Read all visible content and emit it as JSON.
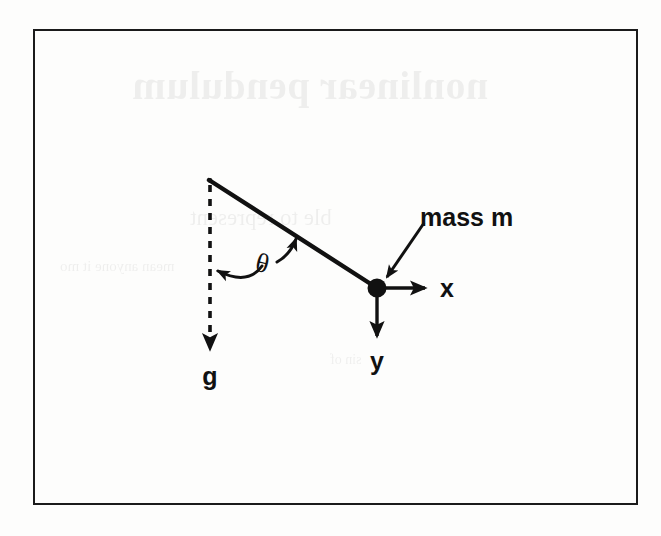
{
  "page": {
    "background_color": "#fdfdfc",
    "ink_color": "#111111"
  },
  "figure": {
    "frame": {
      "border_color": "#1b1b1b",
      "x": 33,
      "y": 29,
      "width": 605,
      "height": 476
    },
    "caption_bleed_through": {
      "note": "faint mirrored show-through text from the reverse side of the scanned page",
      "title": "nonlinear pendulum",
      "subtitle": "ble to represent",
      "line1": "mean   anyone   it   mo",
      "line2": "sin  of"
    },
    "labels": {
      "mass": "mass m",
      "x_axis": "x",
      "y_axis": "y",
      "gravity": "g",
      "angle": "θ"
    },
    "geometry": {
      "pivot": {
        "x": 210,
        "y": 180
      },
      "bob": {
        "x": 377,
        "y": 288,
        "radius": 9
      },
      "vertical_dashed_end": {
        "x": 210,
        "y": 350
      },
      "x_arrow_end": {
        "x": 427,
        "y": 288
      },
      "y_arrow_end": {
        "x": 377,
        "y": 338
      },
      "rod_angle_from_vertical_deg": 57,
      "mass_leader_start": {
        "x": 424,
        "y": 224
      },
      "mass_leader_end": {
        "x": 386,
        "y": 279
      }
    },
    "elements": {
      "rod": "pendulum rod from pivot to mass",
      "dashed_vertical": "vertical reference line marking equilibrium / gravity direction",
      "angle_arc": "double headed curved arrow between vertical and rod"
    }
  }
}
